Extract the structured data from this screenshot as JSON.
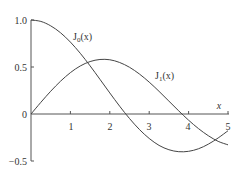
{
  "chart_data": {
    "type": "line",
    "title": "",
    "xlabel": "x",
    "ylabel": "",
    "xlim": [
      0,
      5
    ],
    "ylim": [
      -0.5,
      1.0
    ],
    "grid": false,
    "legend": "inline labels",
    "x_ticks": [
      "1",
      "2",
      "3",
      "4",
      "5"
    ],
    "y_ticks": [
      "1.0",
      "0.5",
      "0",
      "−0.5"
    ],
    "x": [
      0,
      0.25,
      0.5,
      0.75,
      1.0,
      1.25,
      1.5,
      1.75,
      2.0,
      2.25,
      2.5,
      2.75,
      3.0,
      3.25,
      3.5,
      3.75,
      4.0,
      4.25,
      4.5,
      4.75,
      5.0
    ],
    "series": [
      {
        "name": "J0(x)",
        "label_main": "J",
        "label_sub": "0",
        "label_arg": "(x)",
        "values": [
          1.0,
          0.985,
          0.938,
          0.864,
          0.765,
          0.646,
          0.512,
          0.369,
          0.224,
          0.083,
          -0.048,
          -0.164,
          -0.26,
          -0.334,
          -0.38,
          -0.401,
          -0.397,
          -0.37,
          -0.321,
          -0.255,
          -0.178
        ]
      },
      {
        "name": "J1(x)",
        "label_main": "J",
        "label_sub": "1",
        "label_arg": "(x)",
        "values": [
          0.0,
          0.124,
          0.242,
          0.349,
          0.44,
          0.511,
          0.558,
          0.58,
          0.577,
          0.548,
          0.497,
          0.426,
          0.339,
          0.241,
          0.137,
          0.033,
          -0.066,
          -0.155,
          -0.231,
          -0.291,
          -0.328
        ]
      }
    ],
    "annotations": [
      "J0(x)",
      "J1(x)",
      "x"
    ]
  },
  "axis": {
    "x_label": "x",
    "y_tick_labels": [
      "1.0",
      "0.5",
      "0",
      "−0.5"
    ],
    "x_tick_labels": [
      "1",
      "2",
      "3",
      "4",
      "5"
    ]
  },
  "labels": {
    "j0": {
      "main": "J",
      "sub": "0",
      "arg": "(x)"
    },
    "j1": {
      "main": "J",
      "sub": "1",
      "arg": "(x)"
    }
  }
}
